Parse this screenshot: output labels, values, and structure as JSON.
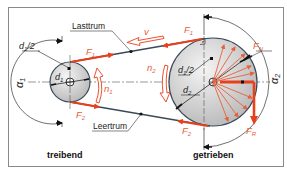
{
  "diagram": {
    "labels": {
      "tight_side": "Lasttrum",
      "slack_side": "Leertrum",
      "driving": "treibend",
      "driven": "getrieben",
      "d1_half": "d",
      "d1_half_sub": "1",
      "d1_half_suffix": "/2",
      "d1": "d",
      "d1_sub": "1",
      "d2_half": "d",
      "d2_half_sub": "1",
      "d2_half_suffix": "/2",
      "d2": "d",
      "d2_sub": "2",
      "F1_left": "F",
      "F1_left_sub": "1",
      "F1_right": "F",
      "F1_right_sub": "1",
      "F2_left": "F",
      "F2_left_sub": "2",
      "F2_right": "F",
      "F2_right_sub": "2",
      "FN": "F",
      "FN_sub": "N",
      "FR": "F",
      "FR_sub": "R",
      "v": "v",
      "n1": "n",
      "n1_sub": "1",
      "n2": "n",
      "n2_sub": "2",
      "alpha1": "α",
      "alpha1_sub": "1",
      "alpha2": "α",
      "alpha2_sub": "2"
    },
    "colors": {
      "force_red": "#e8401c",
      "light_red": "#f08060",
      "belt": "#3a4a5a",
      "pulley_fill": "#d8d8d8",
      "line": "#333333",
      "frame": "#8a8a8a"
    }
  }
}
